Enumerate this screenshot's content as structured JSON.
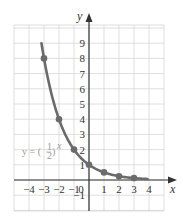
{
  "chart_data": {
    "type": "line",
    "title": "",
    "xlabel": "x",
    "ylabel": "y",
    "function_label": "y = (1/2)^x",
    "x_ticks": [
      -4,
      -3,
      -2,
      -1,
      0,
      1,
      2,
      3,
      4
    ],
    "y_ticks": [
      -1,
      1,
      2,
      3,
      4,
      5,
      6,
      7,
      8,
      9
    ],
    "xlim": [
      -5,
      5
    ],
    "ylim": [
      -2,
      10
    ],
    "grid": true,
    "points": [
      {
        "x": -3,
        "y": 8
      },
      {
        "x": -2,
        "y": 4
      },
      {
        "x": -1,
        "y": 2
      },
      {
        "x": 0,
        "y": 1
      },
      {
        "x": 1,
        "y": 0.5
      },
      {
        "x": 2,
        "y": 0.25
      },
      {
        "x": 3,
        "y": 0.125
      }
    ],
    "curve_range": [
      -3.17,
      3.9
    ],
    "colors": {
      "curve": "#6b6b6b",
      "grid": "#d4d4d4",
      "axis": "#333333"
    }
  },
  "labels": {
    "x_axis": "x",
    "y_axis": "y",
    "equation_prefix": "y = (",
    "equation_num": "1",
    "equation_den": "2",
    "equation_suffix": ")",
    "equation_exp": "x",
    "x_tick_labels": [
      "−4",
      "−3",
      "−2",
      "−1",
      "0",
      "1",
      "2",
      "3",
      "4"
    ],
    "y_tick_labels": [
      "9",
      "8",
      "7",
      "6",
      "5",
      "4",
      "3",
      "2",
      "1",
      "−1"
    ]
  }
}
